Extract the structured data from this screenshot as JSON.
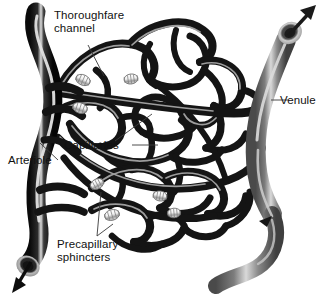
{
  "figure": {
    "background_color": "#ffffff",
    "label_color": "#111111"
  },
  "labels": {
    "thoroughfare_channel": "Thoroughfare\nchannel",
    "venule": "Venule",
    "capillaries": "Capillaries",
    "arteriole": "Arteriole",
    "precapillary_sphincters": "Precapillary\nsphincters"
  },
  "structures": {
    "arteriole": {
      "name": "Arteriole",
      "color": "#111111",
      "highlight_color": "#e8e8e8",
      "flow_direction": "down-left",
      "cut_end_color": "#9a9a9a"
    },
    "venule": {
      "name": "Venule",
      "color": "#6e6e6e",
      "highlight_color": "#d5d5d5",
      "flow_direction": "up-right",
      "cut_end_color": "#a8a8a8"
    },
    "capillaries": {
      "name": "Capillaries",
      "color": "#1b1b1b",
      "highlight_color": "#bdbdbd"
    },
    "precapillary_sphincters": {
      "name": "Precapillary sphincters",
      "color": "#f2f2f2",
      "count": 6
    },
    "thoroughfare_channel": {
      "name": "Thoroughfare channel",
      "color": "#1b1b1b"
    }
  },
  "leaders": {
    "color": "#3a3a3a",
    "width": 0.9
  }
}
